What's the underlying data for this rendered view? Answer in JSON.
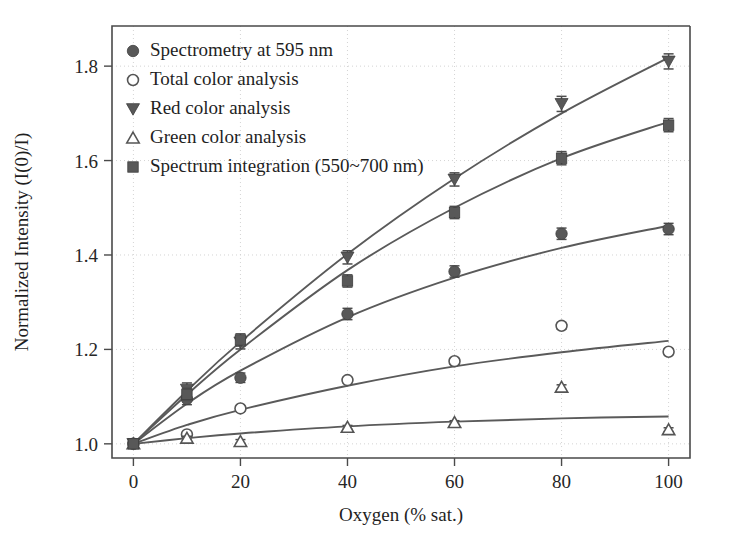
{
  "chart_data": {
    "type": "scatter",
    "title": "",
    "xlabel": "Oxygen (% sat.)",
    "ylabel": "Normalized Intensity (I(0)/I)",
    "xlim": [
      -4,
      104
    ],
    "ylim": [
      0.97,
      1.885
    ],
    "xticks": [
      0,
      20,
      40,
      60,
      80,
      100
    ],
    "yticks": [
      1.0,
      1.2,
      1.4,
      1.6,
      1.8
    ],
    "xtick_labels": [
      "0",
      "20",
      "40",
      "60",
      "80",
      "100"
    ],
    "ytick_labels": [
      "1.0",
      "1.2",
      "1.4",
      "1.6",
      "1.8"
    ],
    "grid": true,
    "grid_style": "dotted",
    "legend_position": "upper-left",
    "x": [
      0,
      10,
      20,
      40,
      60,
      80,
      100
    ],
    "series": [
      {
        "name": "Spectrometry at 595 nm",
        "marker": "filled-circle",
        "color": "#585858",
        "values": [
          1.0,
          1.095,
          1.14,
          1.275,
          1.365,
          1.445,
          1.455
        ],
        "errors": [
          0.004,
          0.012,
          0.01,
          0.012,
          0.012,
          0.012,
          0.012
        ],
        "fit_values": [
          1.0,
          1.085,
          1.155,
          1.268,
          1.352,
          1.415,
          1.462
        ]
      },
      {
        "name": "Total color analysis",
        "marker": "open-circle",
        "color": "#555555",
        "values": [
          1.0,
          1.02,
          1.075,
          1.135,
          1.175,
          1.25,
          1.195
        ],
        "errors": [
          0.003,
          0.005,
          0.005,
          0.006,
          0.006,
          0.007,
          0.006
        ],
        "fit_values": [
          1.0,
          1.04,
          1.072,
          1.123,
          1.164,
          1.194,
          1.218
        ]
      },
      {
        "name": "Red color analysis",
        "marker": "filled-down-triangle",
        "color": "#585858",
        "values": [
          1.0,
          1.115,
          1.215,
          1.395,
          1.56,
          1.72,
          1.81
        ],
        "errors": [
          0.004,
          0.014,
          0.014,
          0.014,
          0.014,
          0.016,
          0.016
        ],
        "fit_values": [
          1.0,
          1.112,
          1.216,
          1.402,
          1.562,
          1.7,
          1.818
        ]
      },
      {
        "name": "Green color analysis",
        "marker": "open-up-triangle",
        "color": "#555555",
        "values": [
          1.0,
          1.012,
          1.005,
          1.035,
          1.045,
          1.12,
          1.03
        ],
        "errors": [
          0.003,
          0.004,
          0.004,
          0.004,
          0.004,
          0.005,
          0.004
        ],
        "fit_values": [
          1.0,
          1.012,
          1.022,
          1.037,
          1.047,
          1.054,
          1.058
        ]
      },
      {
        "name": "Spectrum integration (550~700 nm)",
        "marker": "filled-square",
        "color": "#585858",
        "values": [
          1.0,
          1.105,
          1.22,
          1.345,
          1.49,
          1.605,
          1.675
        ],
        "errors": [
          0.004,
          0.013,
          0.013,
          0.013,
          0.013,
          0.014,
          0.014
        ],
        "fit_values": [
          1.0,
          1.104,
          1.2,
          1.368,
          1.5,
          1.605,
          1.682
        ]
      }
    ]
  },
  "legend": {
    "items": [
      {
        "label": "Spectrometry at 595 nm",
        "marker": "filled-circle"
      },
      {
        "label": "Total color analysis",
        "marker": "open-circle"
      },
      {
        "label": "Red color analysis",
        "marker": "filled-down-triangle"
      },
      {
        "label": "Green color analysis",
        "marker": "open-up-triangle"
      },
      {
        "label": "Spectrum integration (550~700 nm)",
        "marker": "filled-square"
      }
    ]
  }
}
